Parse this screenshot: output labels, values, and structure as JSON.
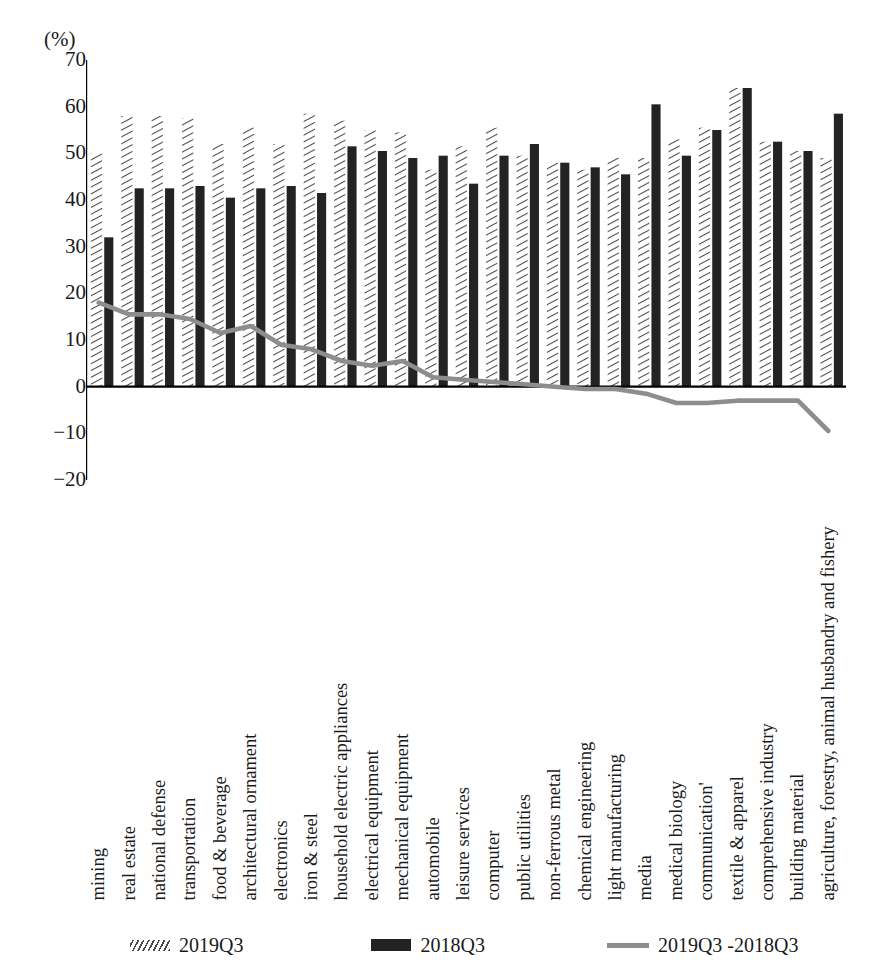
{
  "chart_data": {
    "type": "bar",
    "title": "",
    "xlabel": "",
    "ylabel": "(%)",
    "ylim": [
      -20,
      70
    ],
    "yticks": [
      70,
      60,
      50,
      40,
      30,
      20,
      10,
      0,
      -10,
      -20
    ],
    "grid": false,
    "legend_position": "bottom",
    "categories": [
      "mining",
      "real estate",
      "national defense",
      "transportation",
      "food & beverage",
      "architectural ornament",
      "electronics",
      "iron & steel",
      "household electric appliances",
      "electrical equipment",
      "mechanical equipment",
      "automobile",
      "leisure services",
      "computer",
      "public utilities",
      "non-ferrous metal",
      "chemical engineering",
      "light manufacturing",
      "media",
      "medical biology",
      "communication'",
      "textile & apparel",
      "comprehensive industry",
      "building material",
      "agriculture, forestry, animal husbandry and fishery"
    ],
    "series": [
      {
        "name": "2019Q3",
        "style": "hatched-bar",
        "color": "#4a4a4a",
        "values": [
          50.0,
          58.0,
          58.0,
          57.5,
          52.0,
          55.5,
          52.0,
          58.5,
          57.0,
          55.0,
          54.5,
          46.5,
          51.5,
          55.5,
          49.5,
          48.0,
          46.5,
          49.0,
          49.0,
          53.0,
          55.5,
          64.0,
          52.5,
          50.5,
          49.0
        ]
      },
      {
        "name": "2018Q3",
        "style": "solid-bar",
        "color": "#232323",
        "values": [
          32.0,
          42.5,
          42.5,
          43.0,
          40.5,
          42.5,
          43.0,
          41.5,
          51.5,
          50.5,
          49.0,
          49.5,
          43.5,
          49.5,
          52.0,
          48.0,
          47.0,
          45.5,
          60.5,
          49.5,
          55.0,
          64.0,
          52.5,
          50.5,
          58.5
        ]
      },
      {
        "name": "2019Q3 -2018Q3",
        "style": "line",
        "color": "#8d8d8d",
        "values": [
          18.0,
          15.5,
          15.5,
          14.5,
          11.5,
          13.0,
          9.0,
          8.0,
          5.5,
          4.5,
          5.5,
          2.0,
          1.5,
          1.0,
          0.5,
          0.0,
          -0.5,
          -0.5,
          -1.5,
          -3.5,
          -3.5,
          -3.0,
          -3.0,
          -3.0,
          -9.5
        ]
      }
    ]
  },
  "legend": {
    "items": [
      {
        "label": "2019Q3",
        "swatch": "hatched-bar-swatch"
      },
      {
        "label": "2018Q3",
        "swatch": "solid-bar-swatch"
      },
      {
        "label": "2019Q3 -2018Q3",
        "swatch": "line-swatch"
      }
    ]
  }
}
